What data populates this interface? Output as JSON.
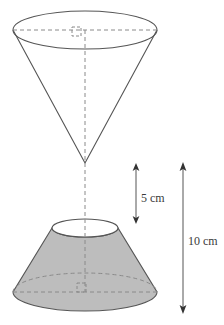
{
  "figure": {
    "background_color": "#ffffff",
    "stroke_color": "#555555",
    "dashed_stroke_color": "#888888",
    "shaded_fill_color": "#bdbdbd",
    "label_color": "#3a3a3a"
  },
  "dimensions": {
    "small_height": {
      "label": "5 cm",
      "value": 5,
      "unit": "cm",
      "arrow_x": 136,
      "arrow_top_y": 164,
      "arrow_bottom_y": 223,
      "label_x": 141,
      "label_y": 199
    },
    "total_height": {
      "label": "10 cm",
      "value": 10,
      "unit": "cm",
      "arrow_x": 183,
      "arrow_top_y": 163,
      "arrow_bottom_y": 313,
      "label_x": 190,
      "label_y": 242
    }
  },
  "shapes": {
    "upper_cone": {
      "name": "inverted-cone",
      "base_ellipse": {
        "cx": 85,
        "cy": 30,
        "rx": 72,
        "ry": 19
      },
      "apex": {
        "x": 85,
        "y": 163
      },
      "filled": false
    },
    "lower_frustum": {
      "name": "shaded-frustum",
      "top_ellipse": {
        "cx": 85,
        "cy": 228,
        "rx": 33,
        "ry": 9
      },
      "bottom_ellipse": {
        "cx": 85,
        "cy": 292,
        "rx": 72,
        "ry": 19
      },
      "filled": true
    },
    "axis_line": {
      "x": 85,
      "top_y": 30,
      "bottom_y": 292
    },
    "right_angle_markers": [
      {
        "name": "top-right-angle-marker",
        "x": 72,
        "y": 27,
        "size": 9
      },
      {
        "name": "bottom-right-angle-marker",
        "x": 77,
        "y": 283,
        "size": 9
      }
    ],
    "radius_lines": [
      {
        "name": "top-radius-line",
        "x1": 13,
        "y1": 30,
        "x2": 157,
        "y2": 30
      },
      {
        "name": "bottom-radius-line",
        "x1": 13,
        "y1": 292,
        "x2": 157,
        "y2": 292
      }
    ]
  }
}
